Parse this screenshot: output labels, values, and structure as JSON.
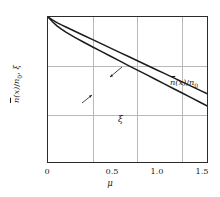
{
  "chart_data": {
    "type": "line",
    "title": "",
    "xlabel": "μ",
    "ylabel": "n̄(x)/n₀, ξ",
    "xlim": [
      0,
      1.8
    ],
    "ylim": [
      0.001,
      1.0
    ],
    "yscale": "log",
    "grid": true,
    "legend_position": "inline-annotations",
    "xticks": [
      "0",
      "0.5",
      "1.0",
      "1.5"
    ],
    "xtick_values": [
      0,
      0.5,
      1.0,
      1.5
    ],
    "ytick_values": [
      1.0,
      0.1,
      0.01,
      0.001
    ],
    "series": [
      {
        "name": "n̄(x)/n₀",
        "annotation": "n̄(x)/n₀",
        "x": [
          0,
          0.05,
          0.1,
          0.15,
          0.2,
          0.3,
          0.4,
          0.5,
          0.6,
          0.7,
          0.8,
          0.9,
          1.0,
          1.1,
          1.2,
          1.3,
          1.4,
          1.5,
          1.6,
          1.7,
          1.8
        ],
        "values": [
          1.0,
          0.87,
          0.77,
          0.69,
          0.625,
          0.512,
          0.42,
          0.345,
          0.283,
          0.232,
          0.19,
          0.156,
          0.128,
          0.105,
          0.086,
          0.0705,
          0.0578,
          0.0474,
          0.0389,
          0.0319,
          0.0261
        ]
      },
      {
        "name": "ξ",
        "annotation": "ξ",
        "x": [
          0,
          0.05,
          0.1,
          0.15,
          0.2,
          0.3,
          0.4,
          0.5,
          0.6,
          0.7,
          0.8,
          0.9,
          1.0,
          1.1,
          1.2,
          1.3,
          1.4,
          1.5,
          1.6,
          1.7,
          1.8
        ],
        "values": [
          1.0,
          0.8,
          0.66,
          0.565,
          0.492,
          0.384,
          0.305,
          0.244,
          0.196,
          0.158,
          0.127,
          0.102,
          0.0825,
          0.0665,
          0.0536,
          0.0432,
          0.0348,
          0.0281,
          0.0226,
          0.0182,
          0.0147
        ]
      }
    ],
    "ytick_labels": [
      {
        "mantissa": "1.0",
        "exp": ""
      },
      {
        "mantissa": "10",
        "exp": "−1"
      },
      {
        "mantissa": "10",
        "exp": "−2"
      },
      {
        "mantissa": "10",
        "exp": "−3"
      }
    ],
    "colors": {
      "curve": "#1c1c1c",
      "grid": "#b9b9b9",
      "axis": "#2b2b2b",
      "background": "#ffffff"
    }
  },
  "axis": {
    "y_label_parts": {
      "n_bar": "n",
      "of_x": "(x)/",
      "n_zero": "n",
      "zero": "0",
      "comma_xi": ", ξ"
    }
  }
}
